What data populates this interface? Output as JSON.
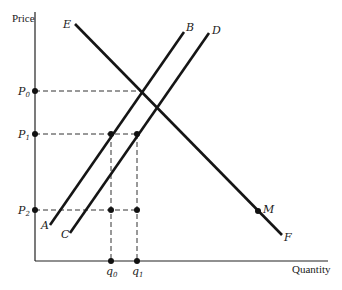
{
  "axes": {
    "y_label": "Price",
    "x_label": "Quantity"
  },
  "curves": [
    {
      "name": "AB",
      "start_label": "A",
      "end_label": "B",
      "type": "upward-sloping"
    },
    {
      "name": "CD",
      "start_label": "C",
      "end_label": "D",
      "type": "upward-sloping"
    },
    {
      "name": "EF",
      "start_label": "E",
      "end_label": "F",
      "type": "downward-sloping"
    }
  ],
  "points": {
    "M": {
      "label": "M",
      "on_curve": "EF"
    }
  },
  "price_levels": [
    {
      "main": "P",
      "sub": "0"
    },
    {
      "main": "P",
      "sub": "1"
    },
    {
      "main": "P",
      "sub": "2"
    }
  ],
  "quantity_levels": [
    {
      "main": "q",
      "sub": "0"
    },
    {
      "main": "q",
      "sub": "1"
    }
  ],
  "colors": {
    "line": "#151515",
    "dashed": "#333333",
    "background": "#ffffff"
  }
}
